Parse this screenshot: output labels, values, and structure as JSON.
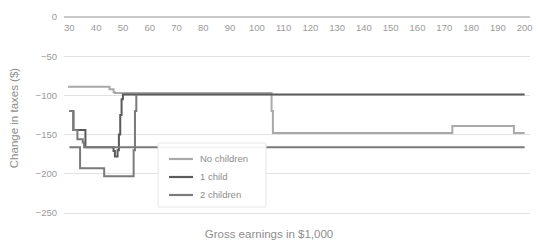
{
  "chart_data": {
    "type": "line",
    "title": "",
    "xlabel": "Gross earnings in $1,000",
    "ylabel": "Change in taxes ($)",
    "xlim": [
      28,
      202
    ],
    "ylim": [
      -250,
      0
    ],
    "xticks": [
      30,
      40,
      50,
      60,
      70,
      80,
      90,
      100,
      110,
      120,
      130,
      140,
      150,
      160,
      170,
      180,
      190,
      200
    ],
    "yticks": [
      0,
      -50,
      -100,
      -150,
      -200,
      -250
    ],
    "xtick_labels": [
      "30",
      "40",
      "50",
      "60",
      "70",
      "80",
      "90",
      "100",
      "110",
      "120",
      "130",
      "140",
      "150",
      "160",
      "170",
      "180",
      "190",
      "200"
    ],
    "ytick_labels": [
      "0",
      "−50",
      "−100",
      "−150",
      "−200",
      "−250"
    ],
    "grid": true,
    "legend_position": "center-left",
    "step_style": "post",
    "series": [
      {
        "name": "No children",
        "color": "#a9a9a9",
        "width": 2.0,
        "x": [
          29.5,
          30,
          33.5,
          34,
          40,
          44.5,
          45,
          46.5,
          47,
          48,
          49,
          50,
          52,
          52.5,
          53,
          54,
          55,
          60,
          70,
          80,
          90,
          100,
          104.5,
          105,
          105.5,
          106,
          110,
          120,
          130,
          140,
          149,
          149.5,
          150,
          155,
          160,
          161.5,
          162,
          165,
          170,
          172.5,
          173,
          175,
          180,
          186,
          186.5,
          187,
          190,
          193,
          195.5,
          196,
          197.5,
          198,
          199,
          200
        ],
        "y": [
          -89,
          -89,
          -89,
          -89,
          -89,
          -89,
          -92,
          -96,
          -97,
          -97,
          -97,
          -97,
          -97,
          -97,
          -97,
          -97,
          -97,
          -97,
          -97,
          -97,
          -97,
          -97,
          -97,
          -97,
          -120,
          -148,
          -148,
          -148,
          -148,
          -148,
          -148,
          -148,
          -148,
          -148,
          -148,
          -148,
          -148,
          -148,
          -148,
          -148,
          -139,
          -139,
          -139,
          -139,
          -139,
          -139,
          -139,
          -139,
          -139,
          -148,
          -148,
          -148,
          -148,
          -148
        ]
      },
      {
        "name": "1 child",
        "color": "#5a5a5a",
        "width": 2.0,
        "x": [
          30,
          31.5,
          32,
          33,
          34,
          35,
          36,
          37,
          38,
          39,
          40,
          41,
          43,
          44.5,
          45,
          46,
          46.5,
          47,
          47.5,
          48,
          48.5,
          49,
          49.5,
          50,
          51,
          52,
          53,
          53.5,
          54,
          55,
          60,
          70,
          80,
          90,
          100,
          110,
          120,
          130,
          140,
          150,
          160,
          165,
          170,
          175,
          180,
          185,
          186,
          186.5,
          187,
          190,
          193,
          194.5,
          195,
          196,
          196.5,
          197,
          197.5,
          198,
          199,
          200
        ],
        "y": [
          -120,
          -144,
          -144,
          -144,
          -144,
          -144,
          -166,
          -166,
          -166,
          -166,
          -166,
          -166,
          -166,
          -166,
          -166,
          -166,
          -171,
          -178,
          -178,
          -170,
          -150,
          -125,
          -105,
          -99,
          -99,
          -99,
          -99,
          -99,
          -99,
          -99,
          -99,
          -99,
          -99,
          -99,
          -99,
          -99,
          -99,
          -99,
          -99,
          -99,
          -99,
          -99,
          -99,
          -99,
          -99,
          -99,
          -99,
          -99,
          -99,
          -99,
          -99,
          -99,
          -99,
          -99,
          -99,
          -99,
          -99,
          -99,
          -99,
          -99
        ]
      },
      {
        "name": "2 children",
        "color": "#7a7a7a",
        "width": 2.0,
        "x": [
          30,
          31.5,
          32,
          33,
          34,
          35,
          35.5,
          36,
          38,
          40,
          41,
          42,
          43,
          44,
          44.5,
          45,
          46,
          47,
          48,
          49,
          50,
          51,
          52,
          53,
          53.5,
          54,
          54.5,
          55,
          56,
          60,
          70,
          80,
          90,
          100,
          105,
          106,
          110,
          120,
          130,
          140,
          148,
          149,
          149.5,
          150,
          155,
          160,
          161,
          161.5,
          162,
          165,
          170,
          175,
          180,
          185,
          186,
          187,
          190,
          193,
          195,
          196,
          196.5,
          197,
          197.5,
          198,
          199,
          200
        ],
        "y": [
          -120,
          -144,
          -144,
          -156,
          -156,
          -160,
          -166,
          -166,
          -166,
          -166,
          -166,
          -166,
          -166,
          -166,
          -166,
          -166,
          -166,
          -166,
          -166,
          -166,
          -166,
          -166,
          -166,
          -166,
          -166,
          -166,
          -166,
          -166,
          -166,
          -166,
          -166,
          -166,
          -166,
          -166,
          -166,
          -166,
          -166,
          -166,
          -166,
          -166,
          -166,
          -166,
          -166,
          -166,
          -166,
          -166,
          -166,
          -166,
          -166,
          -166,
          -166,
          -166,
          -166,
          -166,
          -166,
          -166,
          -166,
          -166,
          -166,
          -166,
          -166,
          -166,
          -166,
          -166,
          -166,
          -166
        ]
      },
      {
        "name": "2 children lower",
        "color": "#7a7a7a",
        "width": 2.0,
        "legend": false,
        "x": [
          30,
          33,
          33.5,
          34,
          35,
          35.5,
          36,
          37,
          38,
          39,
          40,
          41,
          42,
          43,
          44,
          44.5,
          45,
          46,
          47,
          48,
          49,
          50,
          51,
          52,
          53,
          53.5,
          54,
          54.5,
          55
        ],
        "y": [
          -166,
          -166,
          -166,
          -193,
          -193,
          -193,
          -193,
          -193,
          -193,
          -193,
          -193,
          -193,
          -193,
          -203,
          -203,
          -203,
          -203,
          -203,
          -203,
          -203,
          -203,
          -203,
          -203,
          -203,
          -203,
          -203,
          -170,
          -120,
          -99
        ]
      }
    ],
    "annotations": []
  },
  "legend": {
    "entries": [
      {
        "label": "No children",
        "color": "#a9a9a9"
      },
      {
        "label": "1 child",
        "color": "#5a5a5a"
      },
      {
        "label": "2 children",
        "color": "#7a7a7a"
      }
    ]
  },
  "colors": {
    "background": "#ffffff",
    "grid": "#e2e2e2",
    "axis": "#c9c9c9",
    "tick_text": "#9a9a9a",
    "title_text": "#8e8e8e"
  }
}
